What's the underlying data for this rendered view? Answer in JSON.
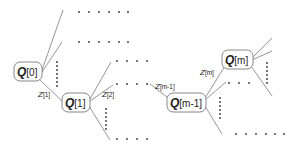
{
  "diagram": {
    "type": "tree",
    "nodes": [
      {
        "id": "q0",
        "symbol": "Q",
        "index": "[0]"
      },
      {
        "id": "q1",
        "symbol": "Q",
        "index": "[1]"
      },
      {
        "id": "qm1",
        "symbol": "Q",
        "index": "[m-1]"
      },
      {
        "id": "qm",
        "symbol": "Q",
        "index": "[m]"
      }
    ],
    "edge_labels": [
      {
        "id": "z1",
        "symbol": "Z",
        "index": "[1]"
      },
      {
        "id": "z2",
        "symbol": "Z",
        "index": "[2]"
      },
      {
        "id": "zm1",
        "symbol": "Z",
        "index": "[m-1]"
      },
      {
        "id": "zm",
        "symbol": "Z",
        "index": "[m]"
      }
    ],
    "colors": {
      "edge": "#8a8a8a",
      "node_border": "#7a7a7a",
      "text": "#222222"
    }
  }
}
